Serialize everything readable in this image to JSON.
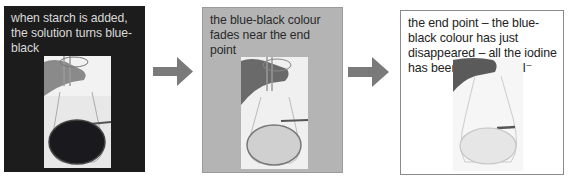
{
  "panels": [
    {
      "caption": "when starch is added, the solution turns blue-black",
      "photo": "flask-with-dark-blue-black-solution",
      "bg_color": "#1c1c1c"
    },
    {
      "caption": "the blue-black colour fades near the end point",
      "photo": "flask-with-faded-solution",
      "bg_color": "#b4b4b4"
    },
    {
      "caption": "the end point – the blue-black colour has just disappeared – all the iodine has been reduced to I⁻",
      "photo": "flask-with-colourless-solution",
      "bg_color": "#ffffff"
    }
  ],
  "arrows": [
    {
      "icon": "arrow-right-icon",
      "color": "#7a7a7a"
    },
    {
      "icon": "arrow-right-icon",
      "color": "#7a7a7a"
    }
  ]
}
